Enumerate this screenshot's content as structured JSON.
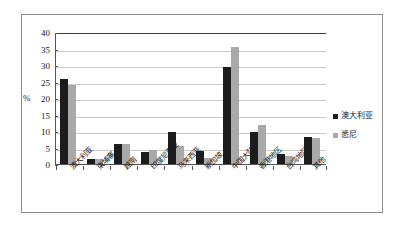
{
  "chart_data": {
    "type": "bar",
    "title": "",
    "subtitle": "",
    "xlabel": "",
    "ylabel": "%",
    "ylim": [
      0,
      40
    ],
    "yticks": [
      0,
      5,
      10,
      15,
      20,
      25,
      30,
      35,
      40
    ],
    "ytick_labels": [
      "0",
      "5",
      "10",
      "15",
      "20",
      "25",
      "30",
      "35",
      "40"
    ],
    "grid": true,
    "legend_position": "right",
    "categories": [
      "澳大利亚",
      "柬埔寨",
      "越南",
      "印度尼西亚",
      "马来西亚",
      "新加坡",
      "中国大陆",
      "香港地区",
      "台湾地区",
      "其他"
    ],
    "series": [
      {
        "name": "澳大利亚",
        "color": "#1c1c1c",
        "values": [
          25.7,
          1.5,
          6.2,
          3.7,
          9.7,
          3.8,
          29.4,
          9.8,
          3.1,
          8.1
        ]
      },
      {
        "name": "悉尼",
        "color": "#a9a9a9",
        "values": [
          24.0,
          1.5,
          6.1,
          4.1,
          5.4,
          1.9,
          35.5,
          11.8,
          2.3,
          8.0
        ]
      }
    ]
  },
  "legend": {
    "entries": [
      {
        "label": "澳大利亚",
        "color": "#1c1c1c"
      },
      {
        "label": "悉尼",
        "color": "#a9a9a9"
      }
    ]
  },
  "axes": {
    "y_title": "%"
  }
}
